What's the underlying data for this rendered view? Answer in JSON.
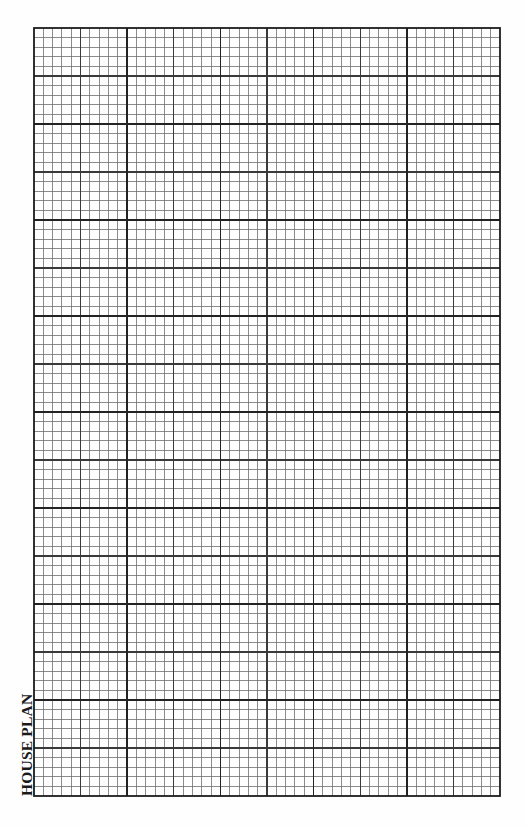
{
  "sheet": {
    "label": "HOUSE PLAN",
    "background": "#fefefe"
  },
  "grid": {
    "left": 34,
    "top": 28,
    "right": 500,
    "bottom": 796,
    "columns": 50,
    "rows": 80,
    "major_every_cols": 10,
    "medium_every_cols": 5,
    "major_every_rows": 10,
    "medium_every_rows": 5,
    "colors": {
      "minor": "#6f6f6f",
      "medium": "#3a3a3a",
      "major": "#222222",
      "border": "#1c1c1c"
    },
    "stroke_widths": {
      "minor": 0.8,
      "medium": 1.3,
      "major": 1.7,
      "border": 1.8
    }
  }
}
